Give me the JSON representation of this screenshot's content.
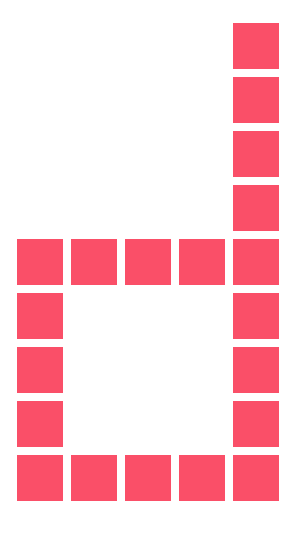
{
  "figure": {
    "name": "pixel-block-glyph",
    "background_color": "#ffffff",
    "square_color": "#fa4f68",
    "canvas": {
      "width": 296,
      "height": 534
    }
  },
  "grid": {
    "columns": 5,
    "rows": 9,
    "square_size": 46,
    "gap": 8,
    "pitch": 54,
    "origin_x": 17,
    "origin_y": 23,
    "matrix": [
      [
        0,
        0,
        0,
        0,
        1
      ],
      [
        0,
        0,
        0,
        0,
        1
      ],
      [
        0,
        0,
        0,
        0,
        1
      ],
      [
        0,
        0,
        0,
        0,
        1
      ],
      [
        1,
        1,
        1,
        1,
        1
      ],
      [
        1,
        0,
        0,
        0,
        1
      ],
      [
        1,
        0,
        0,
        0,
        1
      ],
      [
        1,
        0,
        0,
        0,
        1
      ],
      [
        1,
        1,
        1,
        1,
        1
      ]
    ],
    "filled_count": 17,
    "empty_count": 28
  }
}
